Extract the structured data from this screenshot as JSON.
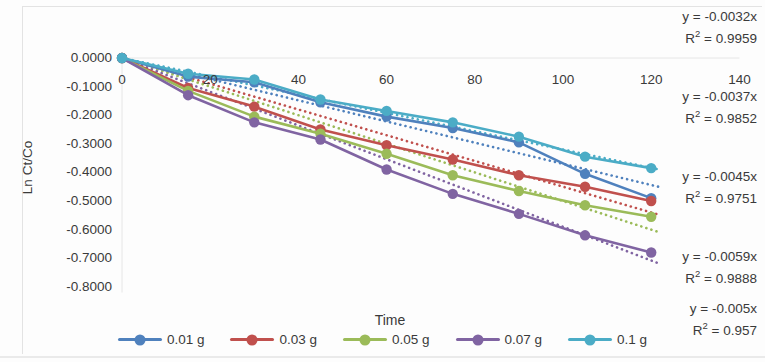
{
  "chart_data": {
    "type": "line",
    "title": "",
    "xlabel": "Time",
    "ylabel": "Ln Ct/Co",
    "xlim": [
      0,
      140
    ],
    "ylim": [
      -0.8,
      0.0
    ],
    "xticks": [
      0,
      20,
      40,
      60,
      80,
      100,
      120,
      140
    ],
    "yticks": [
      "0.0000",
      "-0.1000",
      "-0.2000",
      "-0.3000",
      "-0.4000",
      "-0.5000",
      "-0.6000",
      "-0.7000",
      "-0.8000"
    ],
    "grid": false,
    "legend_position": "bottom",
    "x": [
      0,
      15,
      30,
      45,
      60,
      75,
      90,
      105,
      120
    ],
    "series": [
      {
        "name": "0.01 g",
        "color": "#4F81BD",
        "values": [
          0.0,
          -0.065,
          -0.085,
          -0.155,
          -0.205,
          -0.245,
          -0.295,
          -0.405,
          -0.49
        ],
        "trendline": {
          "equation": "y = -0.0037x",
          "r2": "R² = 0.9852",
          "slope": -0.0037
        }
      },
      {
        "name": "0.03 g",
        "color": "#C0504D",
        "values": [
          0.0,
          -0.105,
          -0.17,
          -0.25,
          -0.305,
          -0.355,
          -0.41,
          -0.45,
          -0.5
        ],
        "trendline": {
          "equation": "y = -0.0045x",
          "r2": "R² = 0.9751",
          "slope": -0.0045
        }
      },
      {
        "name": "0.05 g",
        "color": "#9BBB59",
        "values": [
          0.0,
          -0.115,
          -0.205,
          -0.265,
          -0.335,
          -0.41,
          -0.465,
          -0.515,
          -0.555
        ],
        "trendline": {
          "equation": "y = -0.005x",
          "r2": "R² = 0.957",
          "slope": -0.005
        }
      },
      {
        "name": "0.07 g",
        "color": "#8064A2",
        "values": [
          0.0,
          -0.13,
          -0.225,
          -0.285,
          -0.39,
          -0.475,
          -0.545,
          -0.62,
          -0.68
        ],
        "trendline": {
          "equation": "y = -0.0059x",
          "r2": "R² = 0.9888",
          "slope": -0.0059
        }
      },
      {
        "name": "0.1 g",
        "color": "#4BACC6",
        "values": [
          0.0,
          -0.055,
          -0.075,
          -0.145,
          -0.185,
          -0.225,
          -0.275,
          -0.345,
          -0.385
        ],
        "trendline": {
          "equation": "y = -0.0032x",
          "r2": "R² = 0.9959",
          "slope": -0.0032
        }
      }
    ],
    "annotations": [
      {
        "equation": "y = -0.0032x",
        "r2_text": "R2 = 0.9959",
        "r2_base": "R",
        "r2_exp": "2",
        "r2_value": " = 0.9959"
      },
      {
        "equation": "y = -0.0037x",
        "r2_text": "R2 = 0.9852",
        "r2_base": "R",
        "r2_exp": "2",
        "r2_value": " = 0.9852"
      },
      {
        "equation": "y = -0.0045x",
        "r2_text": "R2 = 0.9751",
        "r2_base": "R",
        "r2_exp": "2",
        "r2_value": " = 0.9751"
      },
      {
        "equation": "y = -0.0059x",
        "r2_text": "R2 = 0.9888",
        "r2_base": "R",
        "r2_exp": "2",
        "r2_value": " = 0.9888"
      },
      {
        "equation": "y = -0.005x",
        "r2_text": "R2 = 0.957",
        "r2_base": "R",
        "r2_exp": "2",
        "r2_value": " = 0.957"
      }
    ]
  }
}
